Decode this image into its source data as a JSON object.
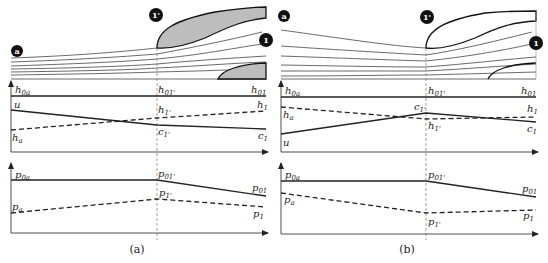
{
  "figure": {
    "panels": [
      {
        "id": "a",
        "caption": "(a)",
        "stations": {
          "inlet": "a",
          "throat": "1'",
          "outlet": "1"
        },
        "top_schematic": {
          "fill": "#bdbdbd",
          "description": "streamlines accelerating into intake; gray-filled lip surfaces"
        },
        "enthalpy_plot": {
          "labels": {
            "h0a": "h",
            "h0a_sub": "0a",
            "h01p": "h",
            "h01p_sub": "01'",
            "h01": "h",
            "h01_sub": "01",
            "u": "u",
            "ha": "h",
            "ha_sub": "a",
            "h1p": "h",
            "h1p_sub": "1'",
            "h1": "h",
            "h1_sub": "1",
            "c1p": "c",
            "c1p_sub": "1'",
            "c1": "c",
            "c1_sub": "1"
          }
        },
        "pressure_plot": {
          "labels": {
            "p0a": "p",
            "p0a_sub": "0a",
            "p01p": "p",
            "p01p_sub": "01'",
            "p01": "p",
            "p01_sub": "01",
            "pa": "p",
            "pa_sub": "a",
            "p1p": "p",
            "p1p_sub": "1'",
            "p1": "p",
            "p1_sub": "1"
          }
        }
      },
      {
        "id": "b",
        "caption": "(b)",
        "stations": {
          "inlet": "a",
          "throat": "1'",
          "outlet": "1"
        },
        "top_schematic": {
          "fill": "#ffffff",
          "description": "streamlines decelerating into intake; unfilled lip surfaces"
        },
        "enthalpy_plot": {
          "labels": {
            "h0a": "h",
            "h0a_sub": "0a",
            "h01p": "h",
            "h01p_sub": "01'",
            "h01": "h",
            "h01_sub": "01",
            "u": "u",
            "ha": "h",
            "ha_sub": "a",
            "h1p": "h",
            "h1p_sub": "1'",
            "h1": "h",
            "h1_sub": "1",
            "c1p": "c",
            "c1p_sub": "1'",
            "c1": "c",
            "c1_sub": "1"
          }
        },
        "pressure_plot": {
          "labels": {
            "p0a": "p",
            "p0a_sub": "0a",
            "p01p": "p",
            "p01p_sub": "01'",
            "p01": "p",
            "p01_sub": "01",
            "pa": "p",
            "pa_sub": "a",
            "p1p": "p",
            "p1p_sub": "1'",
            "p1": "p",
            "p1_sub": "1"
          }
        }
      }
    ]
  }
}
